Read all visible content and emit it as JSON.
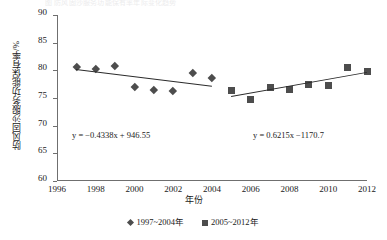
{
  "figure": {
    "top_caption_remnant": "图 防风固沙服务功能保有率年际变化趋势",
    "x_axis_title": "年份",
    "y_axis_title": "防风固沙服务功能保有率/%"
  },
  "legend": {
    "items": [
      {
        "label": "1997~2004年",
        "marker": "diamond-marker",
        "color": "#4d4d4d"
      },
      {
        "label": "2005~2012年",
        "marker": "square-marker",
        "color": "#4d4d4d"
      }
    ]
  },
  "annotations": {
    "equation_1": "y = −0.4338x + 946.55",
    "equation_2": "y = 0.6215x −1170.7"
  },
  "chart_data": {
    "type": "scatter",
    "title": "",
    "subtitle": "",
    "xlabel": "年份",
    "ylabel": "防风固沙服务功能保有率/%",
    "xlim": [
      1996,
      2012
    ],
    "ylim": [
      60,
      90
    ],
    "xticks": [
      1996,
      1998,
      2000,
      2002,
      2004,
      2006,
      2008,
      2010,
      2012
    ],
    "yticks": [
      60,
      65,
      70,
      75,
      80,
      85,
      90
    ],
    "grid": false,
    "legend_position": "bottom",
    "series": [
      {
        "name": "1997~2004年",
        "marker": "diamond",
        "color": "#4d4d4d",
        "x": [
          1997,
          1998,
          1999,
          2000,
          2001,
          2002,
          2003,
          2004
        ],
        "values": [
          80.7,
          80.3,
          80.8,
          77.0,
          76.4,
          76.3,
          79.5,
          78.6
        ],
        "trendline": {
          "equation": "y = −0.4338x + 946.55",
          "slope": -0.4338,
          "intercept": 946.55,
          "x_start": 1997,
          "x_end": 2004
        }
      },
      {
        "name": "2005~2012年",
        "marker": "square",
        "color": "#4d4d4d",
        "x": [
          2005,
          2006,
          2007,
          2008,
          2009,
          2010,
          2011,
          2012
        ],
        "values": [
          76.3,
          74.8,
          76.9,
          76.6,
          77.5,
          77.3,
          80.5,
          79.8
        ],
        "trendline": {
          "equation": "y = 0.6215x −1170.7",
          "slope": 0.6215,
          "intercept": -1170.7,
          "x_start": 2005,
          "x_end": 2012
        }
      }
    ]
  }
}
